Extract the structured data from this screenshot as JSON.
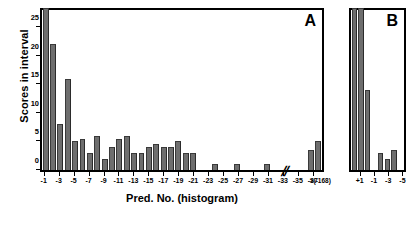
{
  "chart_data": {
    "type": "bar",
    "title": "",
    "ylabel": "Scores in interval",
    "xlabel": "Pred. No. (histogram)",
    "ylim": [
      0,
      28
    ],
    "yticks": [
      0,
      5,
      10,
      15,
      20,
      25
    ],
    "ytick_labels": [
      "0",
      "5",
      "10",
      "15",
      "20",
      "25"
    ],
    "grid": false,
    "legend": null,
    "panels": [
      {
        "letter": "A",
        "axis_break": true,
        "axis_break_symbol": "//",
        "xtick_labels": [
          "-1",
          "-3",
          "-5",
          "-7",
          "-9",
          "-11",
          "-13",
          "-15",
          "-17",
          "-19",
          "-21",
          "-23",
          "-25",
          "-27",
          "-29",
          "-31",
          "-33",
          "-35",
          "-37",
          ">(-168)"
        ],
        "categories": [
          "-1",
          "-2",
          "-3",
          "-4",
          "-5",
          "-6",
          "-7",
          "-8",
          "-9",
          "-10",
          "-11",
          "-12",
          "-13",
          "-14",
          "-15",
          "-16",
          "-17",
          "-18",
          "-19",
          "-20",
          "-21",
          "-22",
          "-23",
          "-24",
          "-25",
          "-26",
          "-27",
          "-28",
          "-29",
          "-30",
          "-31",
          "-32",
          "-33",
          "-34",
          "-35",
          "-36",
          "-37",
          ">(-168)"
        ],
        "values": [
          29,
          22,
          8,
          16,
          5,
          5.5,
          3,
          6,
          2,
          4,
          5.5,
          6,
          3,
          3,
          4,
          4.5,
          4,
          4,
          5,
          3,
          3,
          0,
          0,
          1,
          0,
          0,
          1,
          0,
          0,
          0,
          1,
          0,
          0,
          0,
          0,
          0,
          3.5,
          5
        ],
        "clipped_bars": [
          0
        ]
      },
      {
        "letter": "B",
        "axis_break": false,
        "xtick_labels": [
          "+1",
          "-1",
          "-3",
          "-5"
        ],
        "categories": [
          "+2",
          "+1",
          "0",
          "-1",
          "-2",
          "-3",
          "-4",
          "-5"
        ],
        "values": [
          29,
          29,
          14,
          0,
          3,
          2,
          3.5,
          0
        ],
        "clipped_bars": [
          0,
          1
        ]
      }
    ]
  }
}
